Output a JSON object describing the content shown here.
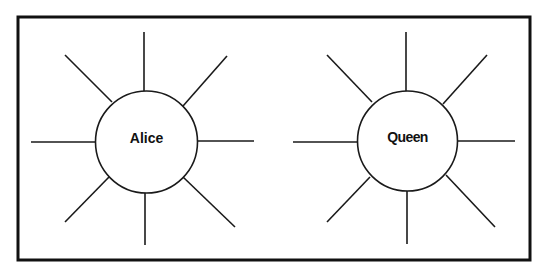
{
  "diagram": {
    "type": "spider-map",
    "frame": {
      "x": 18,
      "y": 17,
      "width": 512,
      "height": 243,
      "stroke": "#111111"
    },
    "hubs": [
      {
        "label": "Alice",
        "center": [
          146.5,
          142
        ],
        "radius": 51,
        "spokes": [
          [
            [
              144,
              32
            ],
            [
              144,
              91
            ]
          ],
          [
            [
              227,
              56
            ],
            [
              183,
              106
            ]
          ],
          [
            [
              198,
              141
            ],
            [
              254,
              141
            ]
          ],
          [
            [
              183,
              177
            ],
            [
              235,
              227
            ]
          ],
          [
            [
              145,
              193
            ],
            [
              145,
              245
            ]
          ],
          [
            [
              109,
              177
            ],
            [
              65,
              222
            ]
          ],
          [
            [
              31,
              142
            ],
            [
              96,
              142
            ]
          ],
          [
            [
              65,
              55
            ],
            [
              112,
              102
            ]
          ]
        ]
      },
      {
        "label": "Queen",
        "center": [
          407.5,
          141
        ],
        "radius": 50,
        "spokes": [
          [
            [
              406,
              32
            ],
            [
              406,
              91
            ]
          ],
          [
            [
              487,
              55
            ],
            [
              443,
              104
            ]
          ],
          [
            [
              457,
              141
            ],
            [
              515,
              141
            ]
          ],
          [
            [
              446,
              175
            ],
            [
              495,
              227
            ]
          ],
          [
            [
              407,
              191
            ],
            [
              407,
              244
            ]
          ],
          [
            [
              370,
              177
            ],
            [
              327,
              222
            ]
          ],
          [
            [
              293,
              142
            ],
            [
              358,
              142
            ]
          ],
          [
            [
              327,
              55
            ],
            [
              372,
              102
            ]
          ]
        ]
      }
    ]
  }
}
